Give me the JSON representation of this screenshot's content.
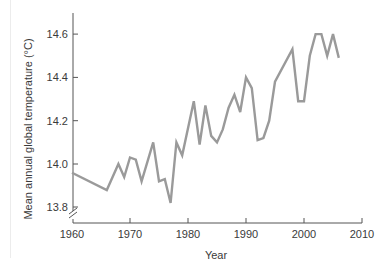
{
  "chart_data": {
    "type": "line",
    "title": "",
    "xlabel": "Year",
    "ylabel": "Mean annual global temperature (°C)",
    "xlim": [
      1960,
      2010
    ],
    "ylim": [
      13.8,
      14.7
    ],
    "y_axis_break": true,
    "grid": false,
    "legend": null,
    "x_ticks": [
      1960,
      1970,
      1980,
      1990,
      2000,
      2010
    ],
    "y_ticks": [
      13.8,
      14.0,
      14.2,
      14.4,
      14.6
    ],
    "y_tick_labels": [
      "13.8",
      "14.0",
      "14.2",
      "14.4",
      "14.6"
    ],
    "x_tick_labels": [
      "1960",
      "1970",
      "1980",
      "1990",
      "2000",
      "2010"
    ],
    "series": [
      {
        "name": "Mean annual global temperature",
        "color": "#9a9a9a",
        "x": [
          1960,
          1966,
          1968,
          1969,
          1970,
          1971,
          1972,
          1974,
          1975,
          1976,
          1977,
          1978,
          1979,
          1981,
          1982,
          1983,
          1984,
          1985,
          1986,
          1987,
          1988,
          1989,
          1990,
          1991,
          1992,
          1993,
          1994,
          1995,
          1998,
          1999,
          2000,
          2001,
          2002,
          2003,
          2004,
          2005,
          2006
        ],
        "values": [
          13.96,
          13.88,
          14.0,
          13.94,
          14.03,
          14.02,
          13.92,
          14.1,
          13.92,
          13.93,
          13.82,
          14.1,
          14.04,
          14.29,
          14.09,
          14.27,
          14.13,
          14.1,
          14.16,
          14.26,
          14.32,
          14.24,
          14.4,
          14.35,
          14.11,
          14.12,
          14.2,
          14.38,
          14.53,
          14.29,
          14.29,
          14.5,
          14.6,
          14.6,
          14.5,
          14.6,
          14.49
        ]
      }
    ]
  },
  "colors": {
    "line": "#9a9a9a",
    "axis": "#555555",
    "text": "#3a3a3a"
  }
}
